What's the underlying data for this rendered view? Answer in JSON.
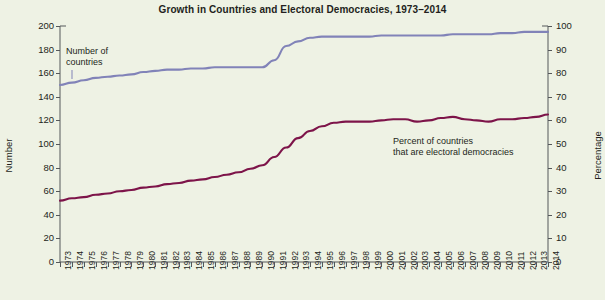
{
  "chart_data": {
    "type": "line",
    "title": "Growth in Countries and Electoral Democracies, 1973–2014",
    "xlabel": "",
    "ylabel": "Number",
    "ylabel_right": "Percentage",
    "ylim": [
      0,
      200
    ],
    "ylim_right": [
      0,
      100
    ],
    "yticks": [
      200,
      180,
      160,
      140,
      120,
      100,
      80,
      60,
      40,
      20,
      0
    ],
    "yticks_right": [
      100,
      90,
      80,
      70,
      60,
      50,
      40,
      30,
      20,
      10,
      0
    ],
    "grid": false,
    "legend_position": "inline-annotations",
    "categories": [
      "1973",
      "1974",
      "1975",
      "1976",
      "1977",
      "1978",
      "1979",
      "1980",
      "1981",
      "1982",
      "1983",
      "1984",
      "1985",
      "1986",
      "1987",
      "1988",
      "1989",
      "1990",
      "1991",
      "1992",
      "1993",
      "1994",
      "1995",
      "1996",
      "1997",
      "1998",
      "1999",
      "2000",
      "2001",
      "2002",
      "2003",
      "2004",
      "2005",
      "2006",
      "2007",
      "2008",
      "2009",
      "2010",
      "2011",
      "2012",
      "2013",
      "2014"
    ],
    "series": [
      {
        "name": "Number of countries",
        "axis": "left",
        "color": "#8183b8",
        "values": [
          150,
          152,
          154,
          156,
          157,
          158,
          159,
          161,
          162,
          163,
          163,
          164,
          164,
          165,
          165,
          165,
          165,
          165,
          171,
          183,
          187,
          190,
          191,
          191,
          191,
          191,
          191,
          192,
          192,
          192,
          192,
          192,
          192,
          193,
          193,
          193,
          193,
          194,
          194,
          195,
          195,
          195
        ]
      },
      {
        "name": "Percent of countries that are electoral democracies",
        "axis": "right",
        "color": "#7d1449",
        "values_number": [
          52,
          54,
          55,
          57,
          58,
          60,
          61,
          63,
          64,
          66,
          67,
          69,
          70,
          72,
          74,
          76,
          79,
          82,
          89,
          97,
          105,
          111,
          115,
          118,
          119,
          119,
          119,
          120,
          121,
          121,
          119,
          120,
          122,
          123,
          121,
          120,
          119,
          121,
          121,
          122,
          123,
          125
        ],
        "values_percent": [
          26.0,
          27.0,
          27.5,
          28.5,
          29.0,
          30.0,
          30.5,
          31.5,
          32.0,
          33.0,
          33.5,
          34.5,
          35.0,
          36.0,
          37.0,
          38.0,
          39.5,
          41.0,
          44.5,
          48.5,
          52.5,
          55.5,
          57.5,
          59.0,
          59.5,
          59.5,
          59.5,
          60.0,
          60.5,
          60.5,
          59.5,
          60.0,
          61.0,
          61.5,
          60.5,
          60.0,
          59.5,
          60.5,
          60.5,
          61.0,
          61.5,
          62.5
        ]
      }
    ],
    "annotations": [
      {
        "text": "Number of\ncountries",
        "x_px": 66,
        "y_px": 46,
        "for_series": "Number of countries"
      },
      {
        "text": "Percent of countries\nthat are electoral democracies",
        "x_px": 393,
        "y_px": 136,
        "for_series": "Percent of countries that are electoral democracies"
      }
    ]
  },
  "colors": {
    "background": "#eef2e4",
    "axis": "#55585a",
    "text": "#231f20",
    "series_countries": "#8183b8",
    "series_democracies": "#7d1449"
  }
}
